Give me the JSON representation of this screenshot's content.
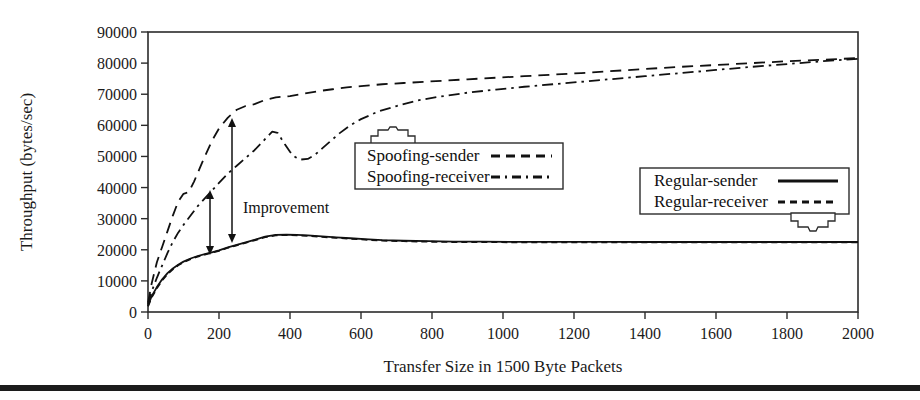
{
  "figure": {
    "background": "#ffffff",
    "line_color": "#111111",
    "axis_color": "#2b2b2b",
    "footer_bar_color": "#1c1c1c"
  },
  "annotations": [
    {
      "id": "improvement",
      "label": "Improvement"
    }
  ],
  "legends": [
    {
      "id": "spoofing-legend",
      "pointer": "up",
      "entries": [
        {
          "label": "Spoofing-sender",
          "dash": "dashed"
        },
        {
          "label": "Spoofing-receiver",
          "dash": "dash-dot"
        }
      ]
    },
    {
      "id": "regular-legend",
      "pointer": "down",
      "entries": [
        {
          "label": "Regular-sender",
          "dash": "solid"
        },
        {
          "label": "Regular-receiver",
          "dash": "short-dash"
        }
      ]
    }
  ],
  "chart_data": {
    "type": "line",
    "title": "",
    "xlabel": "Transfer Size in 1500 Byte Packets",
    "ylabel": "Throughput (bytes/sec)",
    "xlim": [
      0,
      2000
    ],
    "ylim": [
      0,
      90000
    ],
    "xticks": [
      0,
      200,
      400,
      600,
      800,
      1000,
      1200,
      1400,
      1600,
      1800,
      2000
    ],
    "yticks": [
      0,
      10000,
      20000,
      30000,
      40000,
      50000,
      60000,
      70000,
      80000,
      90000
    ],
    "grid": false,
    "legend_position": "inside",
    "series": [
      {
        "name": "Spoofing-sender",
        "dash": "dashed",
        "x": [
          0,
          10,
          25,
          40,
          55,
          70,
          85,
          100,
          115,
          130,
          145,
          160,
          180,
          200,
          225,
          250,
          275,
          300,
          330,
          360,
          400,
          440,
          480,
          520,
          560,
          600,
          660,
          720,
          780,
          840,
          900,
          980,
          1060,
          1140,
          1220,
          1300,
          1400,
          1500,
          1600,
          1700,
          1800,
          1900,
          2000
        ],
        "y": [
          3000,
          9000,
          16000,
          21000,
          26000,
          31000,
          35500,
          38000,
          38500,
          42000,
          46000,
          50000,
          55000,
          59000,
          62500,
          65000,
          66200,
          66800,
          68200,
          69000,
          69400,
          70200,
          71000,
          71600,
          72200,
          72600,
          73200,
          73600,
          74000,
          74400,
          74800,
          75300,
          75800,
          76300,
          76800,
          77400,
          78100,
          78800,
          79400,
          80000,
          80600,
          81100,
          81600
        ]
      },
      {
        "name": "Spoofing-receiver",
        "dash": "dash-dot",
        "x": [
          0,
          10,
          25,
          40,
          55,
          70,
          85,
          100,
          120,
          140,
          160,
          180,
          200,
          225,
          250,
          275,
          300,
          325,
          350,
          365,
          385,
          400,
          415,
          430,
          450,
          470,
          490,
          510,
          540,
          570,
          600,
          650,
          700,
          760,
          820,
          900,
          980,
          1060,
          1140,
          1220,
          1300,
          1400,
          1500,
          1600,
          1700,
          1800,
          1900,
          2000
        ],
        "y": [
          2500,
          6500,
          11000,
          15000,
          19000,
          22500,
          25500,
          28000,
          31000,
          34000,
          36500,
          39000,
          41500,
          44500,
          47000,
          49500,
          52000,
          55000,
          58000,
          57600,
          54000,
          51500,
          49800,
          49000,
          49200,
          50500,
          52500,
          54500,
          57500,
          60000,
          62000,
          64500,
          66200,
          68000,
          69200,
          70500,
          71500,
          72400,
          73200,
          74000,
          74800,
          75800,
          76800,
          77800,
          78800,
          79700,
          80600,
          81400
        ]
      },
      {
        "name": "Regular-sender",
        "dash": "solid",
        "x": [
          0,
          10,
          25,
          40,
          55,
          70,
          85,
          100,
          120,
          140,
          160,
          180,
          200,
          225,
          250,
          275,
          300,
          330,
          360,
          390,
          420,
          450,
          490,
          530,
          570,
          610,
          660,
          720,
          790,
          860,
          940,
          1020,
          1100,
          1200,
          1300,
          1400,
          1500,
          1600,
          1700,
          1800,
          1900,
          2000
        ],
        "y": [
          2000,
          5000,
          8000,
          10500,
          12500,
          14000,
          15200,
          16200,
          17200,
          18000,
          18600,
          19200,
          19800,
          20800,
          21600,
          22400,
          23200,
          24200,
          24800,
          24900,
          24800,
          24600,
          24300,
          24000,
          23700,
          23400,
          23100,
          22900,
          22750,
          22650,
          22600,
          22560,
          22540,
          22520,
          22510,
          22500,
          22500,
          22500,
          22500,
          22500,
          22500,
          22500
        ]
      },
      {
        "name": "Regular-receiver",
        "dash": "short-dash",
        "x": [
          0,
          10,
          25,
          40,
          55,
          70,
          85,
          100,
          120,
          140,
          160,
          180,
          200,
          225,
          250,
          275,
          300,
          330,
          360,
          390,
          420,
          450,
          490,
          530,
          570,
          610,
          660,
          720,
          790,
          860,
          940,
          1020,
          1100,
          1200,
          1300,
          1400,
          1500,
          1600,
          1700,
          1800,
          1900,
          2000
        ],
        "y": [
          1800,
          4600,
          7600,
          10200,
          12200,
          13700,
          15000,
          16000,
          17000,
          17800,
          18450,
          19050,
          19650,
          20650,
          21450,
          22250,
          23050,
          24050,
          24650,
          24750,
          24650,
          24450,
          24150,
          23850,
          23550,
          23250,
          22950,
          22750,
          22600,
          22500,
          22450,
          22420,
          22400,
          22390,
          22380,
          22370,
          22370,
          22370,
          22370,
          22370,
          22370,
          22370
        ]
      }
    ]
  }
}
